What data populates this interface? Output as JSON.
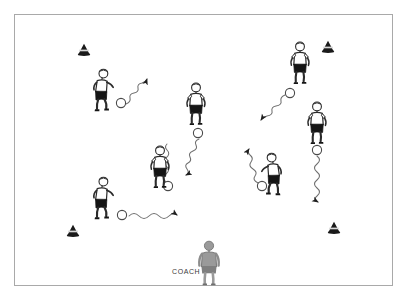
{
  "diagram": {
    "background_color": "#ffffff",
    "frame": {
      "border_color": "#a9a9a9",
      "x": 14,
      "y": 14,
      "width": 379,
      "height": 272
    },
    "coach_label": {
      "text": "COACH",
      "x": 173,
      "y": 271,
      "color": "#3a3a3a"
    },
    "colors": {
      "jersey": "#ffffff",
      "shorts": "#1a1a1a",
      "outline": "#2b2b2b",
      "cone": "#1a1a1a",
      "ball_stroke": "#4a4a4a",
      "path_stroke": "#6e6e6e",
      "coach_fill": "#9a9a9a"
    },
    "cones": [
      {
        "name": "cone-top-left",
        "x": 83,
        "y": 50
      },
      {
        "name": "cone-top-right",
        "x": 327,
        "y": 47
      },
      {
        "name": "cone-bottom-left",
        "x": 72,
        "y": 231
      },
      {
        "name": "cone-bottom-right",
        "x": 333,
        "y": 228
      }
    ],
    "players": [
      {
        "name": "player-upper-left",
        "x": 104,
        "y": 93,
        "pose": "dribbling-right",
        "has_ball": true,
        "ball_x": 121,
        "ball_y": 103
      },
      {
        "name": "player-upper-middle",
        "x": 196,
        "y": 103,
        "pose": "running-forward",
        "has_ball": true,
        "ball_x": 198,
        "ball_y": 133
      },
      {
        "name": "player-upper-right",
        "x": 300,
        "y": 62,
        "pose": "running-forward",
        "has_ball": true,
        "ball_x": 290,
        "ball_y": 93
      },
      {
        "name": "player-right",
        "x": 317,
        "y": 123,
        "pose": "standing",
        "has_ball": true,
        "ball_x": 317,
        "ball_y": 150
      },
      {
        "name": "player-center",
        "x": 160,
        "y": 167,
        "pose": "standing",
        "has_ball": true,
        "ball_x": 168,
        "ball_y": 186
      },
      {
        "name": "player-lower-left",
        "x": 104,
        "y": 200,
        "pose": "dribbling-right",
        "has_ball": true,
        "ball_x": 122,
        "ball_y": 215
      },
      {
        "name": "player-lower-right",
        "x": 270,
        "y": 175,
        "pose": "dribbling-left",
        "has_ball": true,
        "ball_x": 262,
        "ball_y": 186
      }
    ],
    "paths": [
      {
        "name": "path-upper-left-to-right",
        "from_x": 126,
        "from_y": 103,
        "to_x": 150,
        "to_y": 78,
        "style": "wavy",
        "arrow": true
      },
      {
        "name": "path-upper-middle-down",
        "from_x": 198,
        "from_y": 138,
        "to_x": 222,
        "to_y": 176,
        "style": "wavy",
        "arrow": true
      },
      {
        "name": "path-upper-right-left",
        "from_x": 285,
        "from_y": 94,
        "to_x": 256,
        "to_y": 120,
        "style": "wavy",
        "arrow": true
      },
      {
        "name": "path-right-down",
        "from_x": 317,
        "from_y": 155,
        "to_x": 318,
        "to_y": 207,
        "style": "wavy",
        "arrow": true
      },
      {
        "name": "path-center-up",
        "from_x": 166,
        "from_y": 181,
        "to_x": 164,
        "to_y": 140,
        "style": "wavy",
        "arrow": false
      },
      {
        "name": "path-lower-left-right",
        "from_x": 128,
        "from_y": 215,
        "to_x": 178,
        "to_y": 214,
        "style": "wavy",
        "arrow": true
      },
      {
        "name": "path-lower-right-up",
        "from_x": 258,
        "from_y": 182,
        "to_x": 240,
        "to_y": 144,
        "style": "wavy",
        "arrow": true
      }
    ],
    "coach": {
      "name": "coach-figure",
      "x": 209,
      "y": 262,
      "facing": "away"
    }
  }
}
